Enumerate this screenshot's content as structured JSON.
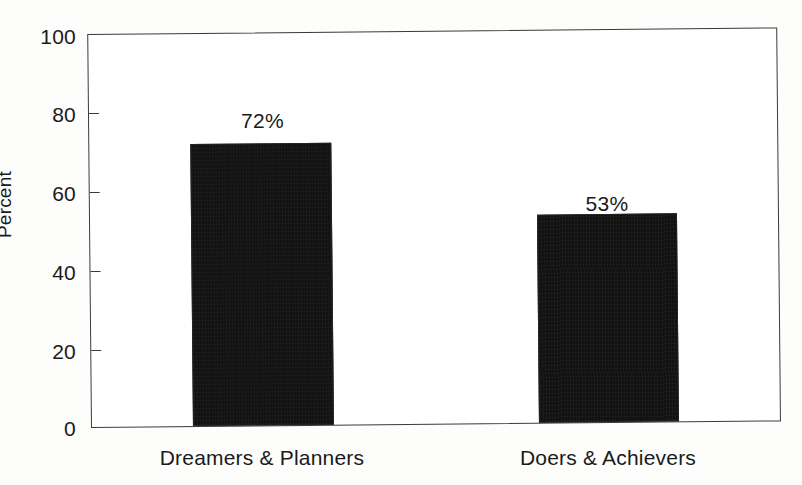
{
  "chart_data": {
    "type": "bar",
    "title": "",
    "subtitle": "",
    "xlabel": "",
    "ylabel": "Percent",
    "categories": [
      "Dreamers & Planners",
      "Doers & Achievers"
    ],
    "values": [
      72,
      53
    ],
    "value_labels": [
      "72%",
      "53%"
    ],
    "ylim": [
      0,
      100
    ],
    "y_ticks": [
      0,
      20,
      40,
      60,
      80,
      100
    ],
    "y_tick_labels": [
      "0",
      "20",
      "40",
      "60",
      "80",
      "100"
    ],
    "grid": false,
    "legend": false,
    "legend_position": "none",
    "bar_color": "#111111",
    "axis_color": "#3a3a3a",
    "background_color": "#ffffff",
    "text_color": "#1a1a1a"
  }
}
